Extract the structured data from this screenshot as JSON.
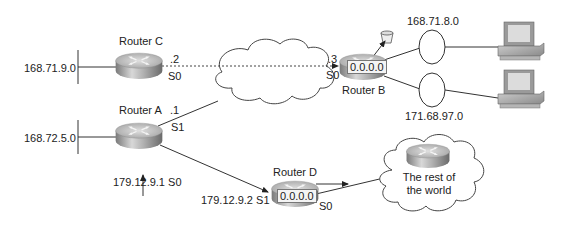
{
  "diagram": {
    "routers": {
      "C": {
        "label": "Router C",
        "network": "168.71.9.0",
        "iface_addr": ".2",
        "iface": "S0"
      },
      "A": {
        "label": "Router A",
        "network": "168.72.5.0",
        "iface_s1_addr": ".1",
        "iface_s1": "S1",
        "s0_label": "179.12.9.1 S0"
      },
      "B": {
        "label": "Router B",
        "addr": "0.0.0.0",
        "iface_addr": ".3",
        "iface": "S0",
        "lan1": "168.71.8.0",
        "lan2": "171.68.97.0"
      },
      "D": {
        "label": "Router D",
        "addr": "0.0.0.0",
        "s1_label": "179.12.9.2 S1",
        "iface": "S0"
      }
    },
    "internet_cloud": {
      "text_line1": "The rest of",
      "text_line2": "the world"
    },
    "colors": {
      "line": "#333333",
      "router_top": "#c8c8c8",
      "router_side": "#8a8a8a"
    }
  }
}
